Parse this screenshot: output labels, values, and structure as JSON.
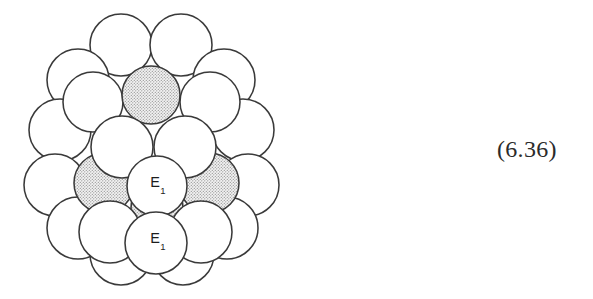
{
  "figure": {
    "name": "close-packed-sphere-cluster",
    "equation_number": "(6.36)",
    "colors": {
      "outline": "#3a3a3a",
      "sphere_fill": "#ffffff",
      "shaded_fill": "#e9e9e9",
      "stipple_dot": "#8a8a8a",
      "text": "#1d1d1d",
      "background": "#ffffff"
    },
    "labels": [
      {
        "id": "label-e1-middle",
        "text": "E",
        "subscript": "1",
        "x": 158,
        "y": 187
      },
      {
        "id": "label-e1-front",
        "text": "E",
        "subscript": "1",
        "x": 158,
        "y": 243
      }
    ],
    "layers": {
      "back": {
        "name": "back-layer",
        "shaded": false,
        "spheres": [
          {
            "cx": 121,
            "cy": 45,
            "r": 31
          },
          {
            "cx": 181,
            "cy": 45,
            "r": 31
          },
          {
            "cx": 78,
            "cy": 80,
            "r": 31
          },
          {
            "cx": 224,
            "cy": 80,
            "r": 31
          },
          {
            "cx": 60,
            "cy": 130,
            "r": 31
          },
          {
            "cx": 243,
            "cy": 130,
            "r": 31
          },
          {
            "cx": 55,
            "cy": 185,
            "r": 31
          },
          {
            "cx": 248,
            "cy": 185,
            "r": 31
          },
          {
            "cx": 78,
            "cy": 228,
            "r": 31
          },
          {
            "cx": 227,
            "cy": 228,
            "r": 31
          },
          {
            "cx": 121,
            "cy": 254,
            "r": 31
          },
          {
            "cx": 183,
            "cy": 254,
            "r": 31
          }
        ]
      },
      "middle": {
        "name": "middle-layer",
        "spheres": [
          {
            "cx": 93,
            "cy": 102,
            "r": 30,
            "shaded": false
          },
          {
            "cx": 210,
            "cy": 102,
            "r": 30,
            "shaded": false
          },
          {
            "cx": 151,
            "cy": 95,
            "r": 29,
            "shaded": true
          },
          {
            "cx": 104,
            "cy": 183,
            "r": 30,
            "shaded": true
          },
          {
            "cx": 209,
            "cy": 183,
            "r": 30,
            "shaded": true
          },
          {
            "cx": 157,
            "cy": 208,
            "r": 26,
            "shaded": true
          }
        ]
      },
      "front": {
        "name": "front-layer",
        "spheres": [
          {
            "cx": 122,
            "cy": 147,
            "r": 31,
            "shaded": false
          },
          {
            "cx": 185,
            "cy": 147,
            "r": 31,
            "shaded": false
          },
          {
            "cx": 157,
            "cy": 186,
            "r": 30,
            "shaded": false,
            "label": "E1"
          },
          {
            "cx": 110,
            "cy": 232,
            "r": 31,
            "shaded": false
          },
          {
            "cx": 201,
            "cy": 232,
            "r": 31,
            "shaded": false
          },
          {
            "cx": 156,
            "cy": 243,
            "r": 31,
            "shaded": false,
            "label": "E1"
          }
        ]
      }
    }
  }
}
